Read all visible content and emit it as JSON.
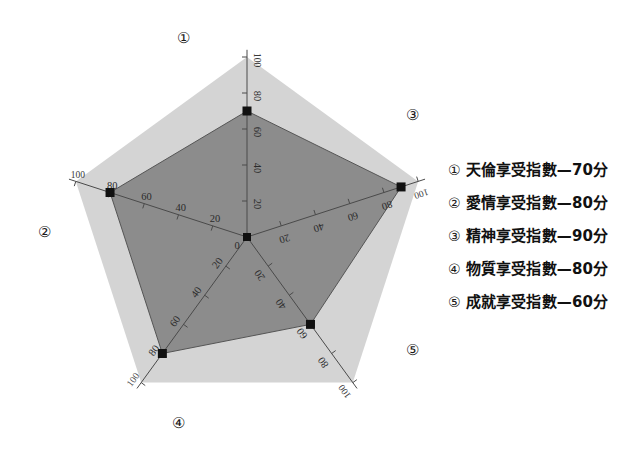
{
  "chart_data": {
    "type": "radar",
    "title": "",
    "categories": [
      "天倫享受指數",
      "愛情享受指數",
      "精神享受指數",
      "物質享受指數",
      "成就享受指數"
    ],
    "axis_markers": [
      "①",
      "②",
      "③",
      "④",
      "⑤"
    ],
    "values": [
      70,
      80,
      90,
      80,
      60
    ],
    "unit": "分",
    "rmin": 0,
    "rmax": 100,
    "tick_values": [
      0,
      20,
      40,
      60,
      80,
      100
    ],
    "center_tick_label": "0",
    "outer_ring_label": "100",
    "grid": false,
    "legend_position": "right",
    "series": [
      {
        "name": "享受指數",
        "values": [
          70,
          80,
          90,
          80,
          60
        ],
        "fill_color": "#8c8c8c",
        "outline_color": "#555555"
      }
    ],
    "background_polygon": {
      "name": "滿分外框",
      "value": 100,
      "fill_color": "#d4d4d4"
    },
    "marker_color": "#111111",
    "axis_line_color": "#4a4a4a"
  },
  "axes": [
    {
      "marker": "①",
      "value": 70,
      "angle_deg": 90,
      "label_x": 183,
      "label_y": 43,
      "ticks": [
        {
          "text": "100",
          "pos": 100
        },
        {
          "text": "80",
          "pos": 80
        },
        {
          "text": "60",
          "pos": 60
        },
        {
          "text": "40",
          "pos": 40
        },
        {
          "text": "20",
          "pos": 20
        }
      ]
    },
    {
      "marker": "②",
      "value": 80,
      "angle_deg": 162,
      "label_x": 44,
      "label_y": 237,
      "ticks": [
        {
          "text": "100",
          "pos": 100
        },
        {
          "text": "80",
          "pos": 80
        },
        {
          "text": "60",
          "pos": 60
        },
        {
          "text": "40",
          "pos": 40
        },
        {
          "text": "20",
          "pos": 20
        }
      ]
    },
    {
      "marker": "④",
      "value": 80,
      "angle_deg": 234,
      "label_x": 178,
      "label_y": 428,
      "ticks": [
        {
          "text": "100",
          "pos": 100
        },
        {
          "text": "80",
          "pos": 80
        },
        {
          "text": "60",
          "pos": 60
        },
        {
          "text": "40",
          "pos": 40
        },
        {
          "text": "20",
          "pos": 20
        }
      ]
    },
    {
      "marker": "⑤",
      "value": 60,
      "angle_deg": 306,
      "label_x": 412,
      "label_y": 355,
      "ticks": [
        {
          "text": "100",
          "pos": 100
        },
        {
          "text": "80",
          "pos": 80
        },
        {
          "text": "60",
          "pos": 60
        },
        {
          "text": "40",
          "pos": 40
        },
        {
          "text": "20",
          "pos": 20
        }
      ]
    },
    {
      "marker": "③",
      "value": 90,
      "angle_deg": 18,
      "label_x": 412,
      "label_y": 120,
      "ticks": [
        {
          "text": "100",
          "pos": 100
        },
        {
          "text": "80",
          "pos": 80
        },
        {
          "text": "60",
          "pos": 60
        },
        {
          "text": "40",
          "pos": 40
        },
        {
          "text": "20",
          "pos": 20
        }
      ]
    }
  ],
  "legend": {
    "items": [
      {
        "marker": "①",
        "text": "天倫享受指數—70分"
      },
      {
        "marker": "②",
        "text": "愛情享受指數—80分"
      },
      {
        "marker": "③",
        "text": "精神享受指數—90分"
      },
      {
        "marker": "④",
        "text": "物質享受指數—80分"
      },
      {
        "marker": "⑤",
        "text": "成就享受指數—60分"
      }
    ]
  }
}
